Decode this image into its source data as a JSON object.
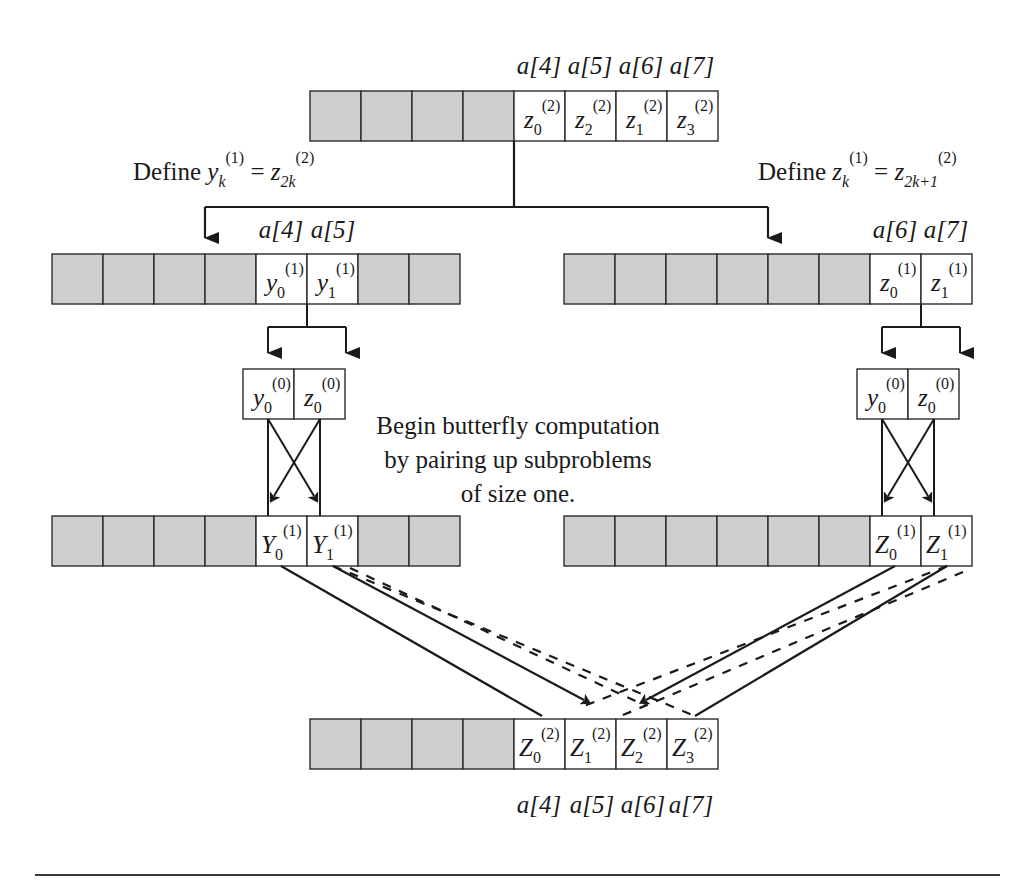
{
  "figure": {
    "title_text_block": {
      "lines": [
        "Begin butterfly computation",
        "by pairing up subproblems",
        "of size one."
      ]
    },
    "define_left": {
      "word": "Define",
      "lhs_base": "y",
      "lhs_sub": "k",
      "lhs_sup": "(1)",
      "equals": "=",
      "rhs_base": "z",
      "rhs_sub": "2k",
      "rhs_sup": "(2)"
    },
    "define_right": {
      "word": "Define",
      "lhs_base": "z",
      "lhs_sub": "k",
      "lhs_sup": "(1)",
      "equals": "=",
      "rhs_base": "z",
      "rhs_sub": "2k+1",
      "rhs_sup": "(2)"
    },
    "arrays": {
      "top": {
        "name": "top-array",
        "cells": 8,
        "shaded": [
          0,
          1,
          2,
          3
        ],
        "labels": [
          {
            "index": 4,
            "base": "z",
            "sub": "0",
            "sup": "(2)"
          },
          {
            "index": 5,
            "base": "z",
            "sub": "2",
            "sup": "(2)"
          },
          {
            "index": 6,
            "base": "z",
            "sub": "1",
            "sup": "(2)"
          },
          {
            "index": 7,
            "base": "z",
            "sub": "3",
            "sup": "(2)"
          }
        ],
        "captions_above": [
          "a[4]",
          "a[5]",
          "a[6]",
          "a[7]"
        ]
      },
      "mid_left": {
        "name": "mid-left-array",
        "cells": 8,
        "shaded": [
          0,
          1,
          2,
          3,
          6,
          7
        ],
        "labels": [
          {
            "index": 4,
            "base": "y",
            "sub": "0",
            "sup": "(1)"
          },
          {
            "index": 5,
            "base": "y",
            "sub": "1",
            "sup": "(1)"
          }
        ],
        "captions_above": [
          "a[4]",
          "a[5]"
        ]
      },
      "mid_right": {
        "name": "mid-right-array",
        "cells": 8,
        "shaded": [
          0,
          1,
          2,
          3,
          4,
          5
        ],
        "labels": [
          {
            "index": 6,
            "base": "z",
            "sub": "0",
            "sup": "(1)"
          },
          {
            "index": 7,
            "base": "z",
            "sub": "1",
            "sup": "(1)"
          }
        ],
        "captions_above": [
          "a[6]",
          "a[7]"
        ]
      },
      "pair_left": {
        "name": "pair-left-box",
        "cells": 2,
        "labels": [
          {
            "index": 0,
            "base": "y",
            "sub": "0",
            "sup": "(0)"
          },
          {
            "index": 1,
            "base": "z",
            "sub": "0",
            "sup": "(0)"
          }
        ]
      },
      "pair_right": {
        "name": "pair-right-box",
        "cells": 2,
        "labels": [
          {
            "index": 0,
            "base": "y",
            "sub": "0",
            "sup": "(0)"
          },
          {
            "index": 1,
            "base": "z",
            "sub": "0",
            "sup": "(0)"
          }
        ]
      },
      "result_left": {
        "name": "result-left-array",
        "cells": 8,
        "shaded": [
          0,
          1,
          2,
          3,
          6,
          7
        ],
        "labels": [
          {
            "index": 4,
            "base": "Y",
            "sub": "0",
            "sup": "(1)"
          },
          {
            "index": 5,
            "base": "Y",
            "sub": "1",
            "sup": "(1)"
          }
        ]
      },
      "result_right": {
        "name": "result-right-array",
        "cells": 8,
        "shaded": [
          0,
          1,
          2,
          3,
          4,
          5
        ],
        "labels": [
          {
            "index": 6,
            "base": "Z",
            "sub": "0",
            "sup": "(1)"
          },
          {
            "index": 7,
            "base": "Z",
            "sub": "1",
            "sup": "(1)"
          }
        ]
      },
      "bottom": {
        "name": "bottom-array",
        "cells": 8,
        "shaded": [
          0,
          1,
          2,
          3
        ],
        "labels": [
          {
            "index": 4,
            "base": "Z",
            "sub": "0",
            "sup": "(2)"
          },
          {
            "index": 5,
            "base": "Z",
            "sub": "1",
            "sup": "(2)"
          },
          {
            "index": 6,
            "base": "Z",
            "sub": "2",
            "sup": "(2)"
          },
          {
            "index": 7,
            "base": "Z",
            "sub": "3",
            "sup": "(2)"
          }
        ],
        "captions_below": [
          "a[4]",
          "a[5]",
          "a[6]",
          "a[7]"
        ]
      }
    },
    "colors": {
      "shaded_cell": "#cfcfcf",
      "white_cell": "#ffffff",
      "stroke": "#2b2b2b",
      "line": "#1a1a1a"
    }
  }
}
